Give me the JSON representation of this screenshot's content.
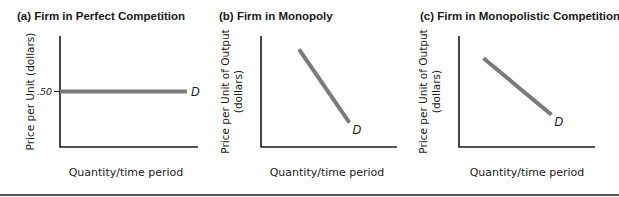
{
  "chart_data": [
    {
      "type": "line",
      "panel": "a",
      "title": "(a) Firm in Perfect Competition",
      "xlabel": "Quantity/time period",
      "ylabel": [
        "Price per Unit (dollars)"
      ],
      "yticks": [
        {
          "label": ".50",
          "value": 0.5
        }
      ],
      "ylim": [
        0,
        1
      ],
      "xlim": [
        0,
        1
      ],
      "grid": false,
      "series": [
        {
          "name": "D",
          "label": "D",
          "x": [
            0.0,
            0.92
          ],
          "y": [
            0.5,
            0.5
          ]
        }
      ]
    },
    {
      "type": "line",
      "panel": "b",
      "title": "(b) Firm in Monopoly",
      "xlabel": "Quantity/time period",
      "ylabel": [
        "Price per Unit of Output",
        "(dollars)"
      ],
      "yticks": [],
      "ylim": [
        0,
        1
      ],
      "xlim": [
        0,
        1
      ],
      "grid": false,
      "series": [
        {
          "name": "D",
          "label": "D",
          "x": [
            0.28,
            0.65
          ],
          "y": [
            0.88,
            0.22
          ]
        }
      ]
    },
    {
      "type": "line",
      "panel": "c",
      "title": "(c) Firm in Monopolistic Competition",
      "xlabel": "Quantity/time period",
      "ylabel": [
        "Price per Unit of Output",
        "(dollars)"
      ],
      "yticks": [],
      "ylim": [
        0,
        1
      ],
      "xlim": [
        0,
        1
      ],
      "grid": false,
      "series": [
        {
          "name": "D",
          "label": "D",
          "x": [
            0.18,
            0.68
          ],
          "y": [
            0.8,
            0.29
          ]
        }
      ]
    }
  ],
  "colors": {
    "axis": "#1a1a1a",
    "curve": "#7a7a7a",
    "rule": "#555555"
  }
}
